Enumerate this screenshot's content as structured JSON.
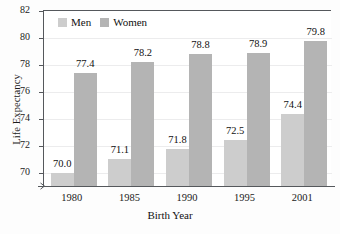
{
  "chart_data": {
    "type": "bar",
    "title": "",
    "xlabel": "Birth Year",
    "ylabel": "Life Expectancy",
    "categories": [
      "1980",
      "1985",
      "1990",
      "1995",
      "2001"
    ],
    "series": [
      {
        "name": "Men",
        "color": "#cdcdcd",
        "values": [
          70.0,
          71.1,
          71.8,
          72.5,
          74.4
        ]
      },
      {
        "name": "Women",
        "color": "#b4b4b4",
        "values": [
          77.4,
          78.2,
          78.8,
          78.9,
          79.8
        ]
      }
    ],
    "value_labels": {
      "men": [
        "70.0",
        "71.1",
        "71.8",
        "72.5",
        "74.4"
      ],
      "women": [
        "77.4",
        "78.2",
        "78.8",
        "78.9",
        "79.8"
      ]
    },
    "ylim": [
      69.0,
      82.0
    ],
    "yticks": [
      70,
      72,
      74,
      76,
      78,
      80,
      82
    ],
    "ytick_labels": [
      "70",
      "72",
      "74",
      "76",
      "78",
      "80",
      "82"
    ],
    "grid": true,
    "axis_break": true,
    "legend_position": "top-left",
    "legend": [
      "Men",
      "Women"
    ]
  }
}
